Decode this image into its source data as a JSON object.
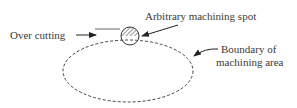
{
  "diagram": {
    "labels": {
      "over_cutting": "Over cutting",
      "spot": "Arbitrary machining spot",
      "boundary_line1": "Boundary of",
      "boundary_line2": "machining area"
    },
    "colors": {
      "stroke": "#3a3a3a",
      "overcut_bar": "#9a9a9a",
      "hatch": "#555555",
      "background": "#ffffff"
    },
    "shapes": {
      "boundary": "dashed-ellipse",
      "spot": "hatched-circle"
    }
  }
}
